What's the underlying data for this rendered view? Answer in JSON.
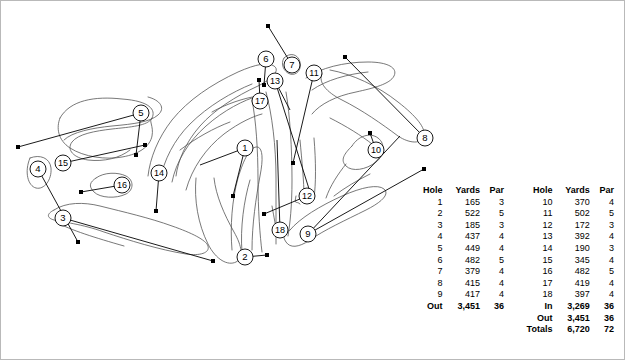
{
  "diagram": {
    "hole_markers": [
      {
        "n": "1",
        "x": 245,
        "y": 148
      },
      {
        "n": "2",
        "x": 245,
        "y": 257
      },
      {
        "n": "3",
        "x": 63,
        "y": 218
      },
      {
        "n": "4",
        "x": 38,
        "y": 169
      },
      {
        "n": "5",
        "x": 141,
        "y": 113
      },
      {
        "n": "6",
        "x": 266,
        "y": 59
      },
      {
        "n": "7",
        "x": 292,
        "y": 65
      },
      {
        "n": "8",
        "x": 425,
        "y": 138
      },
      {
        "n": "9",
        "x": 308,
        "y": 234
      },
      {
        "n": "10",
        "x": 376,
        "y": 150
      },
      {
        "n": "11",
        "x": 314,
        "y": 73
      },
      {
        "n": "12",
        "x": 307,
        "y": 196
      },
      {
        "n": "13",
        "x": 275,
        "y": 81
      },
      {
        "n": "14",
        "x": 159,
        "y": 173
      },
      {
        "n": "15",
        "x": 63,
        "y": 163
      },
      {
        "n": "16",
        "x": 122,
        "y": 185
      },
      {
        "n": "17",
        "x": 260,
        "y": 101
      },
      {
        "n": "18",
        "x": 280,
        "y": 230
      }
    ],
    "tee_markers": [
      {
        "x": 18,
        "y": 147
      },
      {
        "x": 78,
        "y": 242
      },
      {
        "x": 213,
        "y": 261
      },
      {
        "x": 136,
        "y": 155
      },
      {
        "x": 156,
        "y": 211
      },
      {
        "x": 268,
        "y": 26
      },
      {
        "x": 345,
        "y": 57
      },
      {
        "x": 424,
        "y": 169
      },
      {
        "x": 370,
        "y": 133
      },
      {
        "x": 264,
        "y": 214
      },
      {
        "x": 293,
        "y": 163
      },
      {
        "x": 264,
        "y": 85
      },
      {
        "x": 259,
        "y": 80
      },
      {
        "x": 145,
        "y": 145
      },
      {
        "x": 81,
        "y": 192
      },
      {
        "x": 233,
        "y": 196
      },
      {
        "x": 310,
        "y": 192
      },
      {
        "x": 267,
        "y": 255
      }
    ]
  },
  "scorecard": {
    "headers": {
      "hole": "Hole",
      "yards": "Yards",
      "par": "Par"
    },
    "front": [
      {
        "hole": "1",
        "yards": "165",
        "par": "3"
      },
      {
        "hole": "2",
        "yards": "522",
        "par": "5"
      },
      {
        "hole": "3",
        "yards": "185",
        "par": "3"
      },
      {
        "hole": "4",
        "yards": "437",
        "par": "4"
      },
      {
        "hole": "5",
        "yards": "449",
        "par": "4"
      },
      {
        "hole": "6",
        "yards": "482",
        "par": "5"
      },
      {
        "hole": "7",
        "yards": "379",
        "par": "4"
      },
      {
        "hole": "8",
        "yards": "415",
        "par": "4"
      },
      {
        "hole": "9",
        "yards": "417",
        "par": "4"
      }
    ],
    "back": [
      {
        "hole": "10",
        "yards": "370",
        "par": "4"
      },
      {
        "hole": "11",
        "yards": "502",
        "par": "5"
      },
      {
        "hole": "12",
        "yards": "172",
        "par": "3"
      },
      {
        "hole": "13",
        "yards": "392",
        "par": "4"
      },
      {
        "hole": "14",
        "yards": "190",
        "par": "3"
      },
      {
        "hole": "15",
        "yards": "345",
        "par": "4"
      },
      {
        "hole": "16",
        "yards": "482",
        "par": "5"
      },
      {
        "hole": "17",
        "yards": "419",
        "par": "4"
      },
      {
        "hole": "18",
        "yards": "397",
        "par": "4"
      }
    ],
    "front_total": {
      "hole": "Out",
      "yards": "3,451",
      "par": "36"
    },
    "back_totals": [
      {
        "hole": "In",
        "yards": "3,269",
        "par": "36"
      },
      {
        "hole": "Out",
        "yards": "3,451",
        "par": "36"
      },
      {
        "hole": "Totals",
        "yards": "6,720",
        "par": "72"
      }
    ]
  },
  "colors": {
    "frame_border": "#b9b9b9",
    "ink": "#000000",
    "fairway_outline": "#5a5a5a",
    "background": "#ffffff"
  }
}
